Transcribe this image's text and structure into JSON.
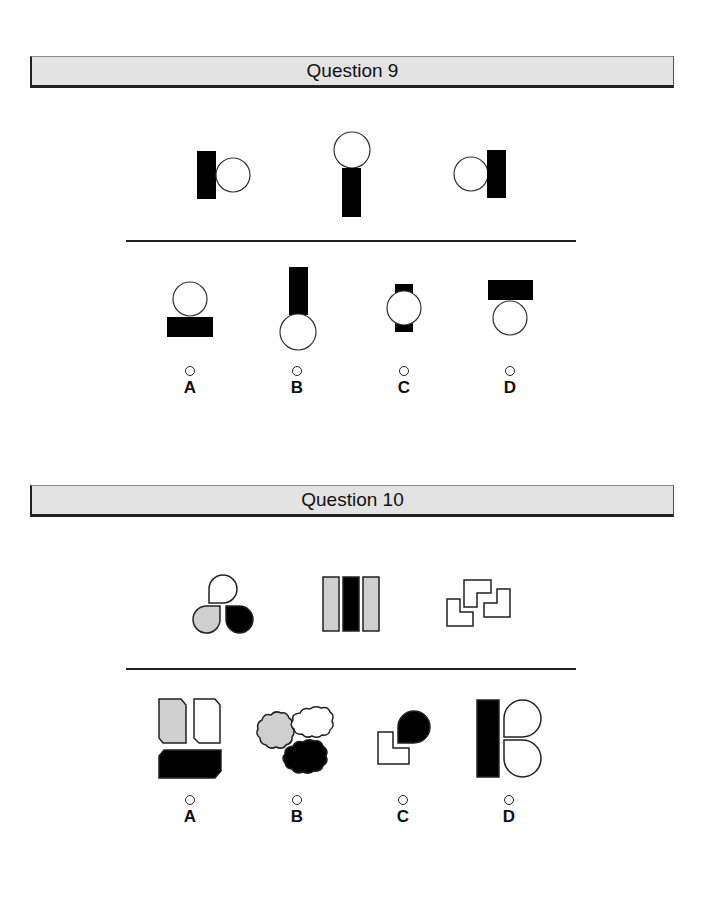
{
  "colors": {
    "header_bg": "#e3e3e3",
    "black": "#000000",
    "gray_fill": "#cfcfcf",
    "white_fill": "#ffffff",
    "stroke": "#222222"
  },
  "questions": [
    {
      "title": "Question 9",
      "sequence": [
        {
          "description": "black bar on left touching circle on right"
        },
        {
          "description": "circle on top of black bar below"
        },
        {
          "description": "circle on left touching black bar on right"
        }
      ],
      "options": [
        {
          "label": "A",
          "description": "circle on top of horizontal black bar"
        },
        {
          "label": "B",
          "description": "vertical black bar above circle"
        },
        {
          "label": "C",
          "description": "circle overlapping vertical black bar"
        },
        {
          "label": "D",
          "description": "horizontal black bar above circle"
        }
      ]
    },
    {
      "title": "Question 10",
      "sequence": [
        {
          "description": "three teardrops: white, gray, black"
        },
        {
          "description": "three vertical bars: gray, black, gray"
        },
        {
          "description": "three white L-shapes"
        }
      ],
      "options": [
        {
          "label": "A",
          "description": "gray and white clipped rectangles above black clipped rectangle"
        },
        {
          "label": "B",
          "description": "gray, white and black clouds"
        },
        {
          "label": "C",
          "description": "white L-shape with black teardrop"
        },
        {
          "label": "D",
          "description": "black bar with two white teardrops"
        }
      ]
    }
  ]
}
